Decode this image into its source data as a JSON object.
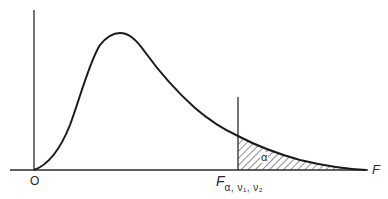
{
  "diagram": {
    "type": "probability density curve with shaded tail area",
    "labels": {
      "origin": "O",
      "x_axis": "F",
      "critical_value_main": "F",
      "critical_value_subscript": "α, ν₁, ν₂",
      "tail_area": "α"
    },
    "colors": {
      "line": "#1a1a1a",
      "axis": "#2a2a2a",
      "hatch": "#333333",
      "background": "#ffffff"
    },
    "geometry": {
      "origin_px": [
        34,
        170
      ],
      "y_axis_top_px": [
        34,
        10
      ],
      "x_axis_end_px": [
        368,
        170
      ],
      "peak_px": [
        118,
        34
      ],
      "critical_line_x_px": 238,
      "critical_line_top_px": 97
    }
  }
}
